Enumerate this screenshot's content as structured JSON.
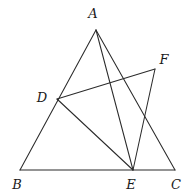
{
  "figure": {
    "kind": "euclidean-geometry-diagram",
    "width": 194,
    "height": 195,
    "background_color": "#ffffff",
    "line_color": "#2b2b2b",
    "label_color": "#1a1a1a",
    "label_style": "italic-serif",
    "points": [
      {
        "id": "A",
        "label": "A",
        "x": 96,
        "y": 30,
        "label_x": 93,
        "label_y": 13
      },
      {
        "id": "B",
        "label": "B",
        "x": 20,
        "y": 170,
        "label_x": 17,
        "label_y": 184
      },
      {
        "id": "C",
        "label": "C",
        "x": 175,
        "y": 170,
        "label_x": 176,
        "label_y": 184
      },
      {
        "id": "D",
        "label": "D",
        "x": 57,
        "y": 99,
        "label_x": 42,
        "label_y": 97
      },
      {
        "id": "E",
        "label": "E",
        "x": 133,
        "y": 170,
        "label_x": 131,
        "label_y": 184
      },
      {
        "id": "F",
        "label": "F",
        "x": 155,
        "y": 69,
        "label_x": 164,
        "label_y": 59
      }
    ],
    "segments": [
      {
        "id": "AB",
        "from": "A",
        "to": "B",
        "name": "segment-ab"
      },
      {
        "id": "BC",
        "from": "B",
        "to": "C",
        "name": "segment-bc"
      },
      {
        "id": "AC",
        "from": "A",
        "to": "C",
        "name": "segment-ac"
      },
      {
        "id": "AE",
        "from": "A",
        "to": "E",
        "name": "segment-ae"
      },
      {
        "id": "DF",
        "from": "D",
        "to": "F",
        "name": "segment-df"
      },
      {
        "id": "DE",
        "from": "D",
        "to": "E",
        "name": "segment-de"
      },
      {
        "id": "FE",
        "from": "F",
        "to": "E",
        "name": "segment-fe"
      }
    ]
  }
}
